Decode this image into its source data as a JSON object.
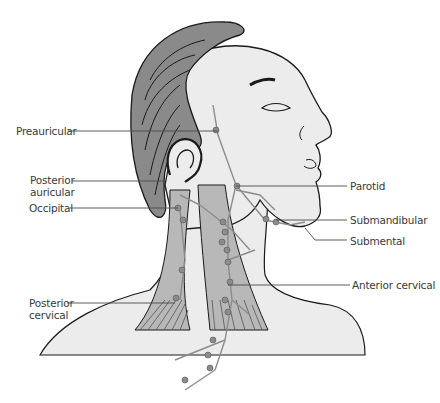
{
  "diagram": {
    "colors": {
      "hair": "#8a8a8a",
      "skin": "#ececec",
      "muscle": "#b8b8b8",
      "lymph": "#8c8c8c",
      "outline": "#1a1a1a",
      "label_text": "#3a3a3a",
      "leader_line": "#4a4a4a"
    },
    "labels_left": [
      {
        "id": "preauricular",
        "text": "Preauricular"
      },
      {
        "id": "posterior-auricular",
        "line1": "Posterior",
        "line2": "auricular"
      },
      {
        "id": "occipital",
        "text": "Occipital"
      },
      {
        "id": "posterior-cervical",
        "line1": "Posterior",
        "line2": "cervical"
      }
    ],
    "labels_right": [
      {
        "id": "parotid",
        "text": "Parotid"
      },
      {
        "id": "submandibular",
        "text": "Submandibular"
      },
      {
        "id": "submental",
        "text": "Submental"
      },
      {
        "id": "anterior-cervical",
        "text": "Anterior cervical"
      }
    ]
  }
}
